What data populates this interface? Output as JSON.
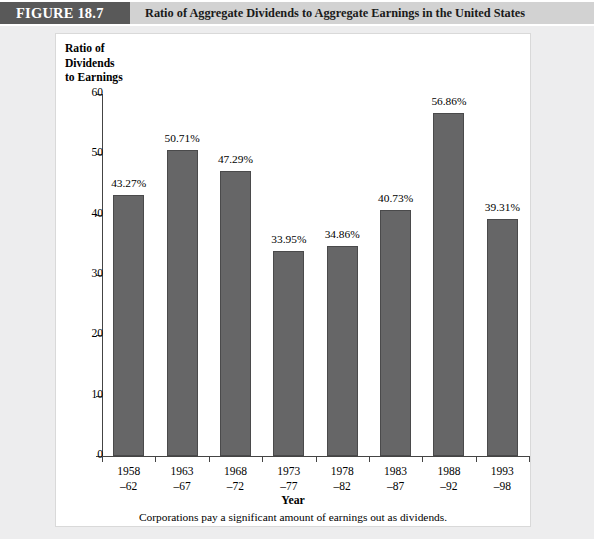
{
  "header": {
    "figure_number": "FIGURE 18.7",
    "figure_title": "Ratio of Aggregate Dividends to Aggregate Earnings in the United States",
    "number_block_color": "#595959",
    "title_band_color": "#d2d2d2"
  },
  "chart_data": {
    "type": "bar",
    "title": "Ratio of Aggregate Dividends to Aggregate Earnings in the United States",
    "subtitle": "",
    "ylabel": "Ratio of Dividends to Earnings",
    "ylabel_lines": [
      "Ratio of",
      "Dividends",
      "to Earnings"
    ],
    "xlabel": "Year",
    "caption": "Corporations pay a significant amount of earnings out as dividends.",
    "categories": [
      "1958–62",
      "1963–67",
      "1968–72",
      "1973–77",
      "1978–82",
      "1983–87",
      "1988–92",
      "1993–98"
    ],
    "category_lines": [
      [
        "1958",
        "–62"
      ],
      [
        "1963",
        "–67"
      ],
      [
        "1968",
        "–72"
      ],
      [
        "1973",
        "–77"
      ],
      [
        "1978",
        "–82"
      ],
      [
        "1983",
        "–87"
      ],
      [
        "1988",
        "–92"
      ],
      [
        "1993",
        "–98"
      ]
    ],
    "values": [
      43.27,
      50.71,
      47.29,
      33.95,
      34.86,
      40.73,
      56.86,
      39.31
    ],
    "value_labels": [
      "43.27%",
      "50.71%",
      "47.29%",
      "33.95%",
      "34.86%",
      "40.73%",
      "56.86%",
      "39.31%"
    ],
    "ylim": [
      0,
      60
    ],
    "yticks": [
      0,
      10,
      20,
      30,
      40,
      50,
      60
    ],
    "ytick_labels": [
      "0",
      "10",
      "20",
      "30",
      "40",
      "50",
      "60"
    ],
    "grid": false,
    "legend": null,
    "legend_position": "none",
    "bar_color": "#666667",
    "bar_edge_color": "#4a4a4b",
    "axis_color": "#444444",
    "plot_background": "#ffffff",
    "page_background": "#ededee"
  }
}
